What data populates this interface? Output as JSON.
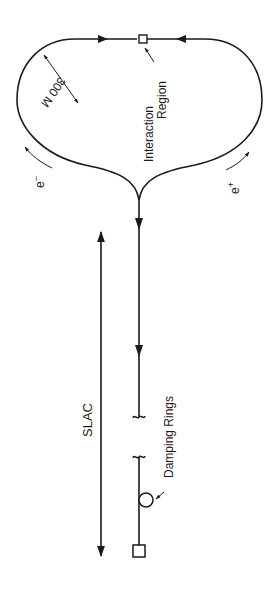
{
  "diagram": {
    "colors": {
      "ink": "#1a1a1a",
      "background": "#ffffff"
    },
    "labels": {
      "interaction_region_line1": "Interaction",
      "interaction_region_line2": "Region",
      "radius": "300 M",
      "electron": "e",
      "electron_sup": "−",
      "positron": "e",
      "positron_sup": "+",
      "linac": "SLAC",
      "damping_rings": "Damping Rings"
    },
    "components": [
      "interaction-region",
      "collider-arc-electron",
      "collider-arc-positron",
      "linac-beamline",
      "damping-ring",
      "source",
      "linac-length-arrow"
    ]
  }
}
